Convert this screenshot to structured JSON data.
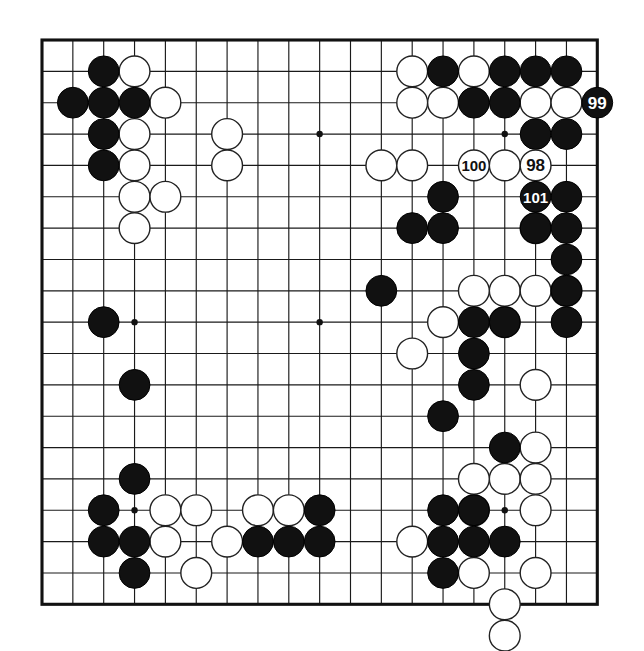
{
  "figure": {
    "kind": "go-board-diagram",
    "board_size": 19,
    "background_color": "#ffffff",
    "line_color": "#1a1a1a",
    "black_color": "#111111",
    "white_color": "#ffffff"
  },
  "geometry": {
    "origin_x": 42,
    "origin_y": 40,
    "step_x": 30.85,
    "step_y": 31.35,
    "stone_radius": 15.4,
    "star_radius": 3.2
  },
  "star_points": [
    {
      "col": 3,
      "row": 3
    },
    {
      "col": 9,
      "row": 3
    },
    {
      "col": 15,
      "row": 3
    },
    {
      "col": 3,
      "row": 9
    },
    {
      "col": 9,
      "row": 9
    },
    {
      "col": 15,
      "row": 9
    },
    {
      "col": 3,
      "row": 15
    },
    {
      "col": 9,
      "row": 15
    },
    {
      "col": 15,
      "row": 15
    }
  ],
  "chart_data": {
    "type": "table",
    "black_stones": [
      {
        "col": 2,
        "row": 1
      },
      {
        "col": 1,
        "row": 2
      },
      {
        "col": 2,
        "row": 2
      },
      {
        "col": 3,
        "row": 2
      },
      {
        "col": 2,
        "row": 3
      },
      {
        "col": 2,
        "row": 4
      },
      {
        "col": 13,
        "row": 1
      },
      {
        "col": 15,
        "row": 1
      },
      {
        "col": 16,
        "row": 1
      },
      {
        "col": 17,
        "row": 1
      },
      {
        "col": 14,
        "row": 2
      },
      {
        "col": 15,
        "row": 2
      },
      {
        "col": 16,
        "row": 3
      },
      {
        "col": 17,
        "row": 3
      },
      {
        "col": 13,
        "row": 5
      },
      {
        "col": 16,
        "row": 5
      },
      {
        "col": 17,
        "row": 5
      },
      {
        "col": 12,
        "row": 6
      },
      {
        "col": 13,
        "row": 6
      },
      {
        "col": 16,
        "row": 6
      },
      {
        "col": 17,
        "row": 6
      },
      {
        "col": 17,
        "row": 7
      },
      {
        "col": 17,
        "row": 8
      },
      {
        "col": 11,
        "row": 8
      },
      {
        "col": 17,
        "row": 9
      },
      {
        "col": 2,
        "row": 9
      },
      {
        "col": 14,
        "row": 9
      },
      {
        "col": 15,
        "row": 9
      },
      {
        "col": 3,
        "row": 11
      },
      {
        "col": 14,
        "row": 10
      },
      {
        "col": 14,
        "row": 11
      },
      {
        "col": 13,
        "row": 12
      },
      {
        "col": 15,
        "row": 13
      },
      {
        "col": 3,
        "row": 14
      },
      {
        "col": 2,
        "row": 15
      },
      {
        "col": 13,
        "row": 15
      },
      {
        "col": 14,
        "row": 15
      },
      {
        "col": 2,
        "row": 16
      },
      {
        "col": 3,
        "row": 16
      },
      {
        "col": 7,
        "row": 16
      },
      {
        "col": 8,
        "row": 16
      },
      {
        "col": 9,
        "row": 16
      },
      {
        "col": 13,
        "row": 16
      },
      {
        "col": 14,
        "row": 16
      },
      {
        "col": 15,
        "row": 16
      },
      {
        "col": 3,
        "row": 17
      },
      {
        "col": 13,
        "row": 17
      },
      {
        "col": 9,
        "row": 15
      }
    ],
    "white_stones": [
      {
        "col": 3,
        "row": 1
      },
      {
        "col": 4,
        "row": 2
      },
      {
        "col": 3,
        "row": 3
      },
      {
        "col": 6,
        "row": 3
      },
      {
        "col": 3,
        "row": 4
      },
      {
        "col": 6,
        "row": 4
      },
      {
        "col": 3,
        "row": 5
      },
      {
        "col": 4,
        "row": 5
      },
      {
        "col": 3,
        "row": 6
      },
      {
        "col": 12,
        "row": 1
      },
      {
        "col": 14,
        "row": 1
      },
      {
        "col": 12,
        "row": 2
      },
      {
        "col": 13,
        "row": 2
      },
      {
        "col": 16,
        "row": 2
      },
      {
        "col": 17,
        "row": 2
      },
      {
        "col": 11,
        "row": 4
      },
      {
        "col": 12,
        "row": 4
      },
      {
        "col": 15,
        "row": 4
      },
      {
        "col": 16,
        "row": 4
      },
      {
        "col": 16,
        "row": 6
      },
      {
        "col": 15,
        "row": 8
      },
      {
        "col": 16,
        "row": 8
      },
      {
        "col": 17,
        "row": 8
      },
      {
        "col": 14,
        "row": 8
      },
      {
        "col": 15,
        "row": 9
      },
      {
        "col": 13,
        "row": 9
      },
      {
        "col": 12,
        "row": 10
      },
      {
        "col": 16,
        "row": 11
      },
      {
        "col": 16,
        "row": 13
      },
      {
        "col": 15,
        "row": 14
      },
      {
        "col": 16,
        "row": 14
      },
      {
        "col": 4,
        "row": 15
      },
      {
        "col": 5,
        "row": 15
      },
      {
        "col": 14,
        "row": 14
      },
      {
        "col": 4,
        "row": 16
      },
      {
        "col": 6,
        "row": 16
      },
      {
        "col": 12,
        "row": 16
      },
      {
        "col": 14,
        "row": 15
      },
      {
        "col": 16,
        "row": 15
      },
      {
        "col": 5,
        "row": 17
      },
      {
        "col": 14,
        "row": 17
      },
      {
        "col": 16,
        "row": 17
      },
      {
        "col": 15,
        "row": 18
      },
      {
        "col": 7,
        "row": 15
      },
      {
        "col": 8,
        "row": 15
      }
    ],
    "numbered_moves": [
      {
        "label": "99",
        "color": "black",
        "col": 18,
        "row": 2,
        "outside_edge": true
      },
      {
        "label": "100",
        "color": "white",
        "col": 14,
        "row": 4,
        "outside_edge": false
      },
      {
        "label": "98",
        "color": "white",
        "col": 16,
        "row": 4,
        "outside_edge": false
      },
      {
        "label": "101",
        "color": "black",
        "col": 16,
        "row": 5,
        "outside_edge": false
      }
    ],
    "off_board_stones": [
      {
        "color": "white",
        "col": 15,
        "row": 19,
        "note": "stone overlapping bottom edge"
      }
    ]
  },
  "labels": {
    "move_98": "98",
    "move_99": "99",
    "move_100": "100",
    "move_101": "101"
  }
}
